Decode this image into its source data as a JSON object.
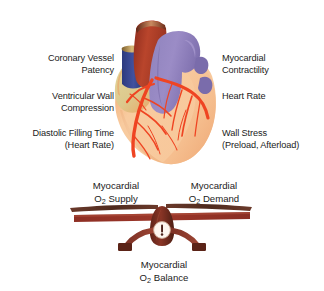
{
  "figure": {
    "background": "#ffffff"
  },
  "supply_factors": {
    "heading": "Myocardial O2 Supply",
    "items": [
      {
        "line1": "Coronary Vessel",
        "line2": "Patency"
      },
      {
        "line1": "Ventricular Wall",
        "line2": "Compression"
      },
      {
        "line1": "Diastolic Filling Time",
        "line2": "(Heart Rate)"
      }
    ]
  },
  "demand_factors": {
    "heading": "Myocardial O2 Demand",
    "items": [
      {
        "line1": "Myocardial",
        "line2": "Contractility"
      },
      {
        "line1": "Heart Rate",
        "line2": ""
      },
      {
        "line1": "Wall Stress",
        "line2": "(Preload, Afterload)"
      }
    ]
  },
  "scale": {
    "supply": {
      "line1": "Myocardial",
      "symbol": "O",
      "subscript": "2",
      "rest": " Supply"
    },
    "demand": {
      "line1": "Myocardial",
      "symbol": "O",
      "subscript": "2",
      "rest": " Demand"
    },
    "balance": {
      "line1": "Myocardial",
      "symbol": "O",
      "subscript": "2",
      "rest": " Balance"
    },
    "tilt_degrees": -1.5,
    "state": "balanced"
  },
  "heart": {
    "label": "anatomical heart illustration, anterior view",
    "parts": [
      {
        "name": "aorta",
        "color": "#a63a28"
      },
      {
        "name": "pulmonary-artery",
        "color": "#8d7ab8"
      },
      {
        "name": "superior-vena-cava",
        "color": "#3b4a96"
      },
      {
        "name": "left-atrial-appendage",
        "color": "#d9c48a"
      },
      {
        "name": "right-ventricle-myocardium",
        "color": "#f6c49a"
      },
      {
        "name": "left-ventricle-myocardium",
        "color": "#f4b183"
      },
      {
        "name": "coronary-arteries",
        "color": "#ef4422"
      },
      {
        "name": "pulmonary-veins",
        "color": "#7a6cab"
      }
    ]
  },
  "colors": {
    "text": "#1b1b1b",
    "beam_dark": "#8e2f24",
    "beam_light": "#6e3b2c",
    "fulcrum": "#7d3226",
    "gauge_face": "#fdf6ef",
    "gauge_needle": "#4a2018"
  }
}
